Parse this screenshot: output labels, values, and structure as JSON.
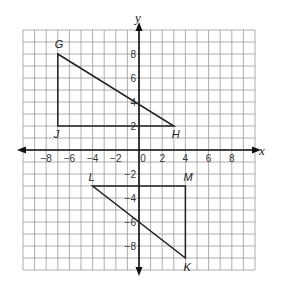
{
  "diagram": {
    "type": "coordinate-plane",
    "x_axis": {
      "label": "x",
      "min": -10,
      "max": 10,
      "ticks": [
        -8,
        -6,
        -4,
        -2,
        0,
        2,
        4,
        6,
        8
      ]
    },
    "y_axis": {
      "label": "y",
      "min": -10,
      "max": 10,
      "ticks_positive": [
        2,
        4,
        6,
        8
      ],
      "ticks_negative": [
        -2,
        -4,
        -6,
        -8
      ]
    },
    "grid": {
      "step": 1,
      "color": "#9a9a9a"
    },
    "triangles": [
      {
        "name": "GHJ",
        "vertices": [
          {
            "label": "G",
            "x": -7,
            "y": 8
          },
          {
            "label": "H",
            "x": 3,
            "y": 2
          },
          {
            "label": "J",
            "x": -7,
            "y": 2
          }
        ]
      },
      {
        "name": "LMK",
        "vertices": [
          {
            "label": "L",
            "x": -4,
            "y": -3
          },
          {
            "label": "M",
            "x": 4,
            "y": -3
          },
          {
            "label": "K",
            "x": 4,
            "y": -9
          }
        ]
      }
    ],
    "line_color": "#222222"
  }
}
